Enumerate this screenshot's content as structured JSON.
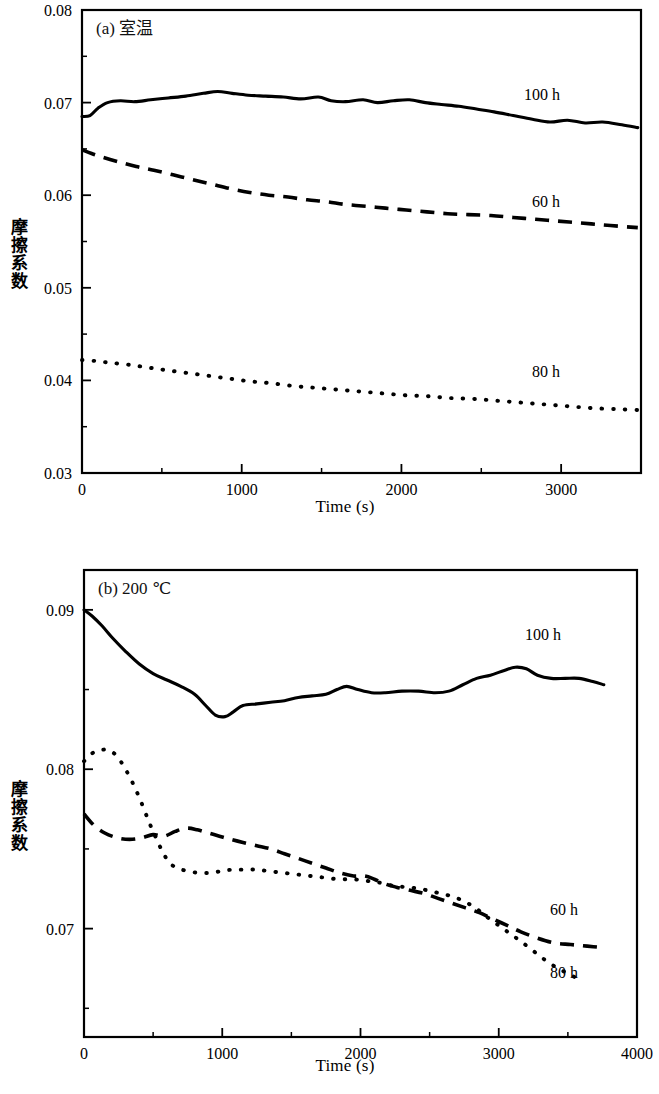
{
  "figure": {
    "panels": [
      "a",
      "b"
    ]
  },
  "panel_a": {
    "tag": "(a) 室温",
    "xlabel": "Time (s)",
    "ylabel": "摩擦系数",
    "xticks": [
      "0",
      "1000",
      "2000",
      "3000"
    ],
    "yticks": [
      "0.03",
      "0.04",
      "0.05",
      "0.06",
      "0.07",
      "0.08"
    ],
    "series_labels": {
      "s100": "100 h",
      "s60": "60 h",
      "s80": "80 h"
    }
  },
  "panel_b": {
    "tag": "(b) 200 ℃",
    "xlabel": "Time (s)",
    "ylabel": "摩擦系数",
    "xticks": [
      "0",
      "1000",
      "2000",
      "3000",
      "4000"
    ],
    "yticks": [
      "0.07",
      "0.08",
      "0.09"
    ],
    "series_labels": {
      "s100": "100 h",
      "s60": "60 h",
      "s80": "80 h"
    }
  },
  "chart_data": [
    {
      "type": "line",
      "panel": "a",
      "title": "(a) 室温",
      "xlabel": "Time (s)",
      "ylabel": "摩擦系数",
      "xlim": [
        0,
        3500
      ],
      "ylim": [
        0.03,
        0.08
      ],
      "xticks": [
        0,
        1000,
        2000,
        3000
      ],
      "yticks": [
        0.03,
        0.04,
        0.05,
        0.06,
        0.07,
        0.08
      ],
      "minor_tick_step_x": 500,
      "minor_tick_step_y": 0.005,
      "grid": false,
      "legend": "inline annotations at right of each curve",
      "series": [
        {
          "name": "100 h",
          "style": "solid",
          "x": [
            0,
            50,
            100,
            160,
            240,
            330,
            430,
            540,
            650,
            760,
            850,
            940,
            1040,
            1150,
            1260,
            1370,
            1480,
            1560,
            1650,
            1760,
            1850,
            1950,
            2050,
            2150,
            2250,
            2360,
            2470,
            2580,
            2700,
            2820,
            2930,
            3040,
            3150,
            3260,
            3380,
            3480
          ],
          "y": [
            0.0685,
            0.0686,
            0.0694,
            0.07,
            0.0702,
            0.0701,
            0.0703,
            0.0705,
            0.0707,
            0.071,
            0.0712,
            0.071,
            0.0708,
            0.0707,
            0.0706,
            0.0704,
            0.0706,
            0.0702,
            0.0701,
            0.0703,
            0.07,
            0.0702,
            0.0703,
            0.07,
            0.0698,
            0.0696,
            0.0693,
            0.069,
            0.0686,
            0.0682,
            0.0679,
            0.0681,
            0.0678,
            0.0679,
            0.0676,
            0.0673
          ]
        },
        {
          "name": "60 h",
          "style": "dashed",
          "x": [
            0,
            60,
            130,
            230,
            340,
            450,
            570,
            690,
            810,
            930,
            1050,
            1170,
            1290,
            1410,
            1530,
            1650,
            1780,
            1900,
            2030,
            2160,
            2290,
            2420,
            2560,
            2700,
            2840,
            2980,
            3120,
            3260,
            3400,
            3480
          ],
          "y": [
            0.0649,
            0.0645,
            0.0641,
            0.0636,
            0.0631,
            0.0627,
            0.0622,
            0.0617,
            0.0612,
            0.0607,
            0.0603,
            0.06,
            0.0598,
            0.0595,
            0.0593,
            0.059,
            0.0588,
            0.0586,
            0.0584,
            0.0582,
            0.058,
            0.0579,
            0.0578,
            0.0576,
            0.0574,
            0.0572,
            0.057,
            0.0568,
            0.0566,
            0.0565
          ]
        },
        {
          "name": "80 h",
          "style": "dotted",
          "x": [
            0,
            80,
            180,
            290,
            410,
            530,
            660,
            790,
            920,
            1050,
            1180,
            1320,
            1460,
            1600,
            1740,
            1880,
            2020,
            2160,
            2300,
            2450,
            2600,
            2750,
            2900,
            3050,
            3200,
            3350,
            3480
          ],
          "y": [
            0.0422,
            0.0421,
            0.0419,
            0.0417,
            0.0414,
            0.0411,
            0.0408,
            0.0405,
            0.0402,
            0.0399,
            0.0397,
            0.0394,
            0.0392,
            0.039,
            0.0388,
            0.0386,
            0.0384,
            0.0383,
            0.0381,
            0.038,
            0.0378,
            0.0376,
            0.0374,
            0.0372,
            0.037,
            0.0369,
            0.0368
          ]
        }
      ]
    },
    {
      "type": "line",
      "panel": "b",
      "title": "(b) 200 ℃",
      "xlabel": "Time (s)",
      "ylabel": "摩擦系数",
      "xlim": [
        0,
        4000
      ],
      "ylim": [
        0.0632,
        0.0925
      ],
      "xticks": [
        0,
        1000,
        2000,
        3000,
        4000
      ],
      "yticks": [
        0.07,
        0.08,
        0.09
      ],
      "minor_tick_step_x": 500,
      "minor_tick_step_y": 0.005,
      "grid": false,
      "legend": "inline annotations at right of each curve",
      "series": [
        {
          "name": "100 h",
          "style": "solid",
          "x": [
            0,
            60,
            130,
            210,
            300,
            400,
            500,
            600,
            700,
            800,
            880,
            950,
            1020,
            1080,
            1150,
            1250,
            1350,
            1450,
            1550,
            1650,
            1750,
            1830,
            1900,
            1980,
            2080,
            2180,
            2300,
            2420,
            2540,
            2640,
            2740,
            2840,
            2940,
            3040,
            3120,
            3200,
            3280,
            3380,
            3480,
            3580,
            3680,
            3760
          ],
          "y": [
            0.09,
            0.0896,
            0.089,
            0.0882,
            0.0874,
            0.0866,
            0.086,
            0.0856,
            0.0852,
            0.0847,
            0.084,
            0.0834,
            0.0833,
            0.0836,
            0.084,
            0.0841,
            0.0842,
            0.0843,
            0.0845,
            0.0846,
            0.0847,
            0.085,
            0.0852,
            0.085,
            0.0848,
            0.0848,
            0.0849,
            0.0849,
            0.0848,
            0.0849,
            0.0853,
            0.0857,
            0.0859,
            0.0862,
            0.0864,
            0.0863,
            0.0859,
            0.0857,
            0.0857,
            0.0857,
            0.0855,
            0.0853
          ]
        },
        {
          "name": "60 h",
          "style": "dashed",
          "x": [
            0,
            70,
            150,
            240,
            330,
            420,
            500,
            580,
            660,
            740,
            820,
            900,
            980,
            1060,
            1150,
            1250,
            1350,
            1450,
            1550,
            1650,
            1750,
            1850,
            1950,
            2030,
            2100,
            2180,
            2260,
            2360,
            2460,
            2560,
            2660,
            2760,
            2860,
            2960,
            3060,
            3160,
            3280,
            3400,
            3520,
            3640,
            3760
          ],
          "y": [
            0.0772,
            0.0765,
            0.076,
            0.0757,
            0.0756,
            0.0757,
            0.0759,
            0.0758,
            0.0761,
            0.0763,
            0.0762,
            0.076,
            0.0758,
            0.0756,
            0.0754,
            0.0752,
            0.075,
            0.0747,
            0.0744,
            0.0741,
            0.0738,
            0.0735,
            0.0733,
            0.0733,
            0.0731,
            0.0728,
            0.0726,
            0.0724,
            0.0722,
            0.0719,
            0.0716,
            0.0713,
            0.071,
            0.0706,
            0.0702,
            0.0698,
            0.0694,
            0.0691,
            0.069,
            0.0689,
            0.0688
          ]
        },
        {
          "name": "80 h",
          "style": "dotted",
          "x": [
            0,
            60,
            120,
            180,
            240,
            300,
            360,
            420,
            470,
            520,
            570,
            620,
            680,
            750,
            830,
            910,
            990,
            1070,
            1160,
            1250,
            1340,
            1440,
            1540,
            1640,
            1740,
            1840,
            1940,
            2040,
            2130,
            2230,
            2330,
            2430,
            2530,
            2630,
            2730,
            2830,
            2920,
            3000,
            3080,
            3160,
            3250,
            3340,
            3430,
            3520,
            3580
          ],
          "y": [
            0.0805,
            0.081,
            0.0812,
            0.0812,
            0.0808,
            0.08,
            0.079,
            0.0778,
            0.0767,
            0.0757,
            0.0748,
            0.0741,
            0.0738,
            0.0736,
            0.0735,
            0.0735,
            0.0736,
            0.0737,
            0.0737,
            0.0737,
            0.0736,
            0.0735,
            0.0734,
            0.0733,
            0.0732,
            0.0731,
            0.0731,
            0.073,
            0.0729,
            0.0727,
            0.0726,
            0.0725,
            0.0723,
            0.0721,
            0.0718,
            0.0713,
            0.0707,
            0.0702,
            0.0697,
            0.0692,
            0.0686,
            0.068,
            0.0675,
            0.0671,
            0.0668
          ]
        }
      ]
    }
  ]
}
